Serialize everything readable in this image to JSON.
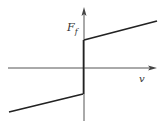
{
  "diagram": {
    "y_axis_label": "F",
    "y_axis_subscript": "f",
    "x_axis_label": "v",
    "colors": {
      "axis": "#555555",
      "curve": "#222222",
      "background": "#ffffff"
    },
    "geometry": {
      "origin": [
        84,
        68
      ],
      "x_axis": {
        "from": [
          8,
          68
        ],
        "to": [
          156,
          68
        ]
      },
      "y_axis": {
        "from": [
          84,
          120
        ],
        "to": [
          84,
          9
        ]
      },
      "upper_branch": {
        "from": [
          84,
          40
        ],
        "to": [
          157,
          21
        ]
      },
      "lower_branch": {
        "from": [
          9,
          112
        ],
        "to": [
          83,
          94
        ]
      },
      "jump": {
        "from": [
          83.5,
          40
        ],
        "to": [
          83.5,
          94
        ]
      }
    }
  }
}
